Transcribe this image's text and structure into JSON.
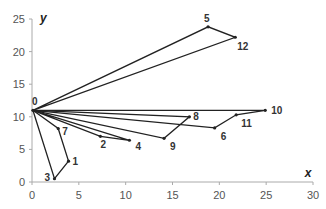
{
  "chart_data": {
    "type": "line",
    "title": "",
    "xlabel": "x",
    "ylabel": "y",
    "xlim": [
      0,
      30
    ],
    "ylim": [
      0,
      25
    ],
    "x_ticks": [
      "0",
      "5",
      "10",
      "15",
      "20",
      "25",
      "30"
    ],
    "y_ticks": [
      "0",
      "5",
      "10",
      "15",
      "20",
      "25"
    ],
    "grid": false,
    "legend": null,
    "nodes": [
      {
        "id": "0",
        "x": 0.1,
        "y": 11.0
      },
      {
        "id": "1",
        "x": 3.9,
        "y": 3.2
      },
      {
        "id": "2",
        "x": 7.3,
        "y": 7.0
      },
      {
        "id": "3",
        "x": 2.4,
        "y": 0.5
      },
      {
        "id": "4",
        "x": 10.4,
        "y": 6.4
      },
      {
        "id": "5",
        "x": 18.8,
        "y": 23.8
      },
      {
        "id": "6",
        "x": 19.5,
        "y": 8.3
      },
      {
        "id": "7",
        "x": 2.8,
        "y": 8.2
      },
      {
        "id": "8",
        "x": 16.8,
        "y": 10.0
      },
      {
        "id": "9",
        "x": 14.1,
        "y": 6.7
      },
      {
        "id": "10",
        "x": 24.9,
        "y": 11.0
      },
      {
        "id": "11",
        "x": 21.8,
        "y": 10.3
      },
      {
        "id": "12",
        "x": 21.7,
        "y": 22.2
      }
    ],
    "routes": [
      [
        "0",
        "5",
        "12",
        "0"
      ],
      [
        "0",
        "10",
        "11",
        "6",
        "0"
      ],
      [
        "0",
        "8",
        "9",
        "0"
      ],
      [
        "0",
        "2",
        "4",
        "0"
      ],
      [
        "0",
        "7",
        "1",
        "3",
        "0"
      ]
    ]
  },
  "colors": {
    "line": "#222222",
    "axis": "#aaaaaa",
    "text": "#555555"
  }
}
